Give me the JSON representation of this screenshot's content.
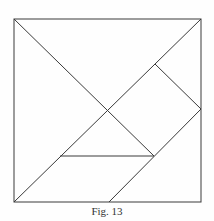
{
  "figure": {
    "caption": "Fig. 13",
    "stroke_color": "#3a3a3a",
    "square": {
      "x1": 14,
      "y1": 19,
      "x2": 201,
      "y2": 202
    },
    "lines": [
      {
        "name": "diagonal-tl-to-center",
        "x1": 14,
        "y1": 19,
        "x2": 154,
        "y2": 156
      },
      {
        "name": "diagonal-bl-to-tr",
        "x1": 14,
        "y1": 202,
        "x2": 201,
        "y2": 19
      },
      {
        "name": "square-piece-upper-edge",
        "x1": 155,
        "y1": 64,
        "x2": 201,
        "y2": 109
      },
      {
        "name": "parallelogram-right-edge",
        "x1": 201,
        "y1": 109,
        "x2": 109,
        "y2": 202
      },
      {
        "name": "small-triangle-base",
        "x1": 60,
        "y1": 156,
        "x2": 154,
        "y2": 156
      }
    ]
  }
}
